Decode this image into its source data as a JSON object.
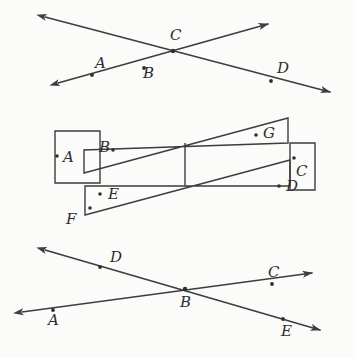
{
  "figure": {
    "background_color": "#fbfbfa",
    "stroke_color": "#3d3d3d",
    "label_color": "#2e2e2e",
    "width": 356,
    "height": 358
  },
  "diagrams": [
    {
      "id": "top-intersecting-lines",
      "type": "two-intersecting-rays",
      "intersection_label": "C",
      "points": [
        {
          "label": "A",
          "x": 95,
          "y": 68,
          "dot_x": 92,
          "dot_y": 75
        },
        {
          "label": "B",
          "x": 143,
          "y": 78,
          "dot_x": 144,
          "dot_y": 68
        },
        {
          "label": "C",
          "x": 170,
          "y": 40,
          "dot_x": 173,
          "dot_y": 51
        },
        {
          "label": "D",
          "x": 277,
          "y": 73,
          "dot_x": 271,
          "dot_y": 81
        }
      ],
      "line1": {
        "from_x": 45,
        "from_y": 17,
        "to_x": 330,
        "to_y": 92,
        "arrows": "both"
      },
      "line2": {
        "from_x": 58,
        "from_y": 83,
        "to_x": 268,
        "to_y": 24,
        "arrows": "both"
      }
    },
    {
      "id": "middle-overlapping-quadrilaterals",
      "type": "overlapping-quadrilaterals",
      "points": [
        {
          "label": "A",
          "x": 63,
          "y": 162,
          "dot_x": 57,
          "dot_y": 156
        },
        {
          "label": "B",
          "x": 99,
          "y": 152,
          "dot_x": 113,
          "dot_y": 150
        },
        {
          "label": "G",
          "x": 268,
          "y": 133,
          "dot_x": 256,
          "dot_y": 135
        },
        {
          "label": "C",
          "x": 296,
          "y": 173,
          "dot_x": 294,
          "dot_y": 158
        },
        {
          "label": "D",
          "x": 293,
          "y": 190,
          "dot_x": 279,
          "dot_y": 186
        },
        {
          "label": "E",
          "x": 113,
          "y": 196,
          "dot_x": 100,
          "dot_y": 194
        },
        {
          "label": "F",
          "x": 68,
          "y": 222,
          "dot_x": 90,
          "dot_y": 208
        }
      ],
      "shapes": {
        "left_rectangle": "55,131 100,131 100,183 55,183",
        "right_rectangle": "290,143 315,143 315,190 290,190",
        "upper_quad": "84,173 288,118 288,143 84,150",
        "lower_quad": "85,215 290,160 290,186 85,186",
        "vertical_divider": "185,143 185,186"
      }
    },
    {
      "id": "bottom-intersecting-lines",
      "type": "two-intersecting-rays",
      "intersection_label": "B",
      "points": [
        {
          "label": "D",
          "x": 110,
          "y": 262,
          "dot_x": 100,
          "dot_y": 267
        },
        {
          "label": "A",
          "x": 50,
          "y": 322,
          "dot_x": 53,
          "dot_y": 310
        },
        {
          "label": "B",
          "x": 180,
          "y": 307,
          "dot_x": 185,
          "dot_y": 289
        },
        {
          "label": "C",
          "x": 272,
          "y": 281,
          "dot_x": 272,
          "dot_y": 279
        },
        {
          "label": "E",
          "x": 285,
          "y": 333,
          "dot_x": 283,
          "dot_y": 319
        }
      ],
      "line1": {
        "from_x": 45,
        "from_y": 250,
        "to_x": 320,
        "to_y": 330,
        "arrows": "both"
      },
      "line2": {
        "from_x": 22,
        "from_y": 312,
        "to_x": 312,
        "to_y": 273,
        "arrows": "both"
      }
    }
  ]
}
